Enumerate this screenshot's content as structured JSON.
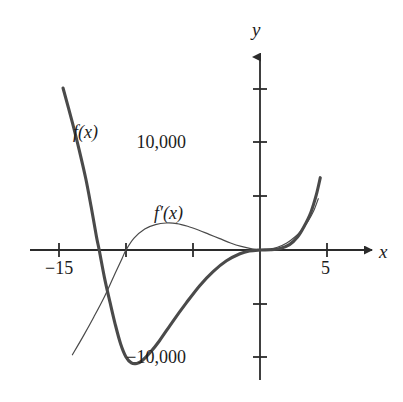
{
  "figure": {
    "background_color": "#ffffff",
    "axis_color": "#2b2b2b",
    "curve_color": "#4a4a4a",
    "text_color": "#1c1c1c"
  },
  "labels": {
    "y_axis": "y",
    "x_axis": "x",
    "y_tick_positive": "10,000",
    "y_tick_negative": "−10,000",
    "x_tick_left": "−15",
    "x_tick_right": "5",
    "curve_f": "f(x)",
    "curve_fprime": "f′(x)"
  },
  "chart_data": {
    "type": "line",
    "title": "",
    "xlabel": "x",
    "ylabel": "y",
    "xlim": [
      -17,
      6.5
    ],
    "ylim": [
      -14000,
      13500
    ],
    "grid": false,
    "legend": "inline-curve-labels",
    "x_ticks": [
      -15,
      -10,
      -5,
      0,
      5
    ],
    "x_tick_labels": [
      "−15",
      "",
      "",
      "",
      "5"
    ],
    "y_ticks": [
      -10000,
      -5000,
      0,
      5000,
      10000
    ],
    "y_tick_labels": [
      "−10,000",
      "",
      "",
      "",
      "10,000"
    ],
    "series": [
      {
        "name": "f(x)",
        "style": "thick",
        "line_width": 3.1,
        "color": "#4a4a4a",
        "points": [
          [
            -14.7,
            15000
          ],
          [
            -14.0,
            11800
          ],
          [
            -13.5,
            9300
          ],
          [
            -13.0,
            6600
          ],
          [
            -12.6,
            4000
          ],
          [
            -12.2,
            1200
          ],
          [
            -12.0,
            0
          ],
          [
            -11.6,
            -2600
          ],
          [
            -11.2,
            -4800
          ],
          [
            -10.8,
            -6900
          ],
          [
            -10.4,
            -8700
          ],
          [
            -10.0,
            -9900
          ],
          [
            -9.6,
            -10450
          ],
          [
            -9.2,
            -10500
          ],
          [
            -8.8,
            -10250
          ],
          [
            -8.2,
            -9500
          ],
          [
            -7.5,
            -8400
          ],
          [
            -6.5,
            -6600
          ],
          [
            -5.5,
            -4900
          ],
          [
            -4.5,
            -3300
          ],
          [
            -3.5,
            -2000
          ],
          [
            -2.5,
            -1000
          ],
          [
            -1.5,
            -350
          ],
          [
            -0.8,
            -90
          ],
          [
            0.0,
            0
          ],
          [
            0.8,
            30
          ],
          [
            1.5,
            150
          ],
          [
            2.2,
            500
          ],
          [
            2.8,
            1200
          ],
          [
            3.3,
            2200
          ],
          [
            3.8,
            3500
          ],
          [
            4.2,
            5100
          ],
          [
            4.5,
            6700
          ]
        ],
        "annotation": {
          "text": "f(x)",
          "x": -13.2,
          "y": 11500
        }
      },
      {
        "name": "f'(x)",
        "style": "thin",
        "line_width": 1.2,
        "color": "#4a4a4a",
        "points": [
          [
            -14.0,
            -9700
          ],
          [
            -13.2,
            -8000
          ],
          [
            -12.4,
            -6200
          ],
          [
            -11.6,
            -4300
          ],
          [
            -10.9,
            -2400
          ],
          [
            -10.3,
            -800
          ],
          [
            -10.0,
            0
          ],
          [
            -9.4,
            1100
          ],
          [
            -8.6,
            1950
          ],
          [
            -7.8,
            2350
          ],
          [
            -7.0,
            2500
          ],
          [
            -6.2,
            2450
          ],
          [
            -5.4,
            2200
          ],
          [
            -4.6,
            1850
          ],
          [
            -3.8,
            1450
          ],
          [
            -3.0,
            1050
          ],
          [
            -2.2,
            650
          ],
          [
            -1.4,
            330
          ],
          [
            -0.6,
            100
          ],
          [
            0.0,
            0
          ],
          [
            0.6,
            50
          ],
          [
            1.3,
            250
          ],
          [
            2.0,
            650
          ],
          [
            2.6,
            1200
          ],
          [
            3.1,
            1850
          ],
          [
            3.6,
            2700
          ],
          [
            4.0,
            3600
          ],
          [
            4.35,
            4750
          ]
        ],
        "annotation": {
          "text": "f′(x)",
          "x": -6.5,
          "y": 3600
        }
      }
    ]
  }
}
